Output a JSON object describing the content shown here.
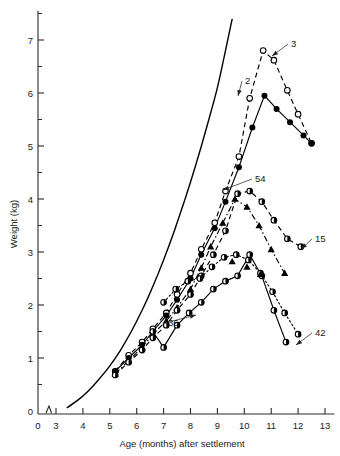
{
  "chart_data": {
    "type": "line",
    "title": "",
    "xlabel": "Age (months) after settlement",
    "ylabel": "Weight (kg)",
    "xlim": [
      0,
      13.4
    ],
    "ylim": [
      0,
      7.55
    ],
    "grid": false,
    "legend_position": "inline-annotations",
    "x_ticks": [
      0,
      3,
      4,
      5,
      6,
      7,
      8,
      9,
      10,
      11,
      12,
      13
    ],
    "x_tick_labels": [
      "0",
      "3",
      "4",
      "5",
      "6",
      "7",
      "8",
      "9",
      "10",
      "11",
      "12",
      "13"
    ],
    "y_ticks": [
      0,
      1,
      2,
      3,
      4,
      5,
      6,
      7
    ],
    "y_tick_labels": [
      "0",
      "1",
      "2",
      "3",
      "4",
      "5",
      "6",
      "7"
    ],
    "y_minor_ticks": [
      0.5,
      1.5,
      2.5,
      3.5,
      4.5,
      5.5,
      6.5,
      7.5
    ],
    "axis_break_x": 2.6,
    "series": [
      {
        "name": "reference-growth-curve",
        "label": "",
        "marker": "none",
        "linestyle": "solid",
        "x": [
          3.4,
          3.8,
          4.2,
          4.6,
          5.0,
          5.4,
          5.8,
          6.2,
          6.6,
          7.0,
          7.4,
          7.8,
          8.2,
          8.6,
          9.0,
          9.3,
          9.55
        ],
        "y": [
          0.06,
          0.2,
          0.38,
          0.6,
          0.85,
          1.15,
          1.5,
          1.9,
          2.35,
          2.85,
          3.4,
          4.0,
          4.65,
          5.35,
          6.1,
          6.8,
          7.4
        ]
      },
      {
        "name": "series-3",
        "label": "3",
        "marker": "open-circle",
        "linestyle": "dashed",
        "x": [
          5.2,
          5.7,
          6.2,
          6.6,
          7.1,
          7.5,
          8.0,
          8.4,
          8.9,
          9.3,
          9.8,
          10.2,
          10.7,
          11.1,
          11.6,
          12.0,
          12.5
        ],
        "y": [
          0.75,
          1.05,
          1.3,
          1.55,
          1.85,
          2.2,
          2.6,
          3.05,
          3.55,
          4.15,
          4.8,
          5.9,
          6.8,
          6.62,
          6.05,
          5.6,
          5.05
        ]
      },
      {
        "name": "series-2",
        "label": "2",
        "marker": "filled-circle",
        "linestyle": "solid",
        "x": [
          5.2,
          5.7,
          6.2,
          6.6,
          7.1,
          7.5,
          8.0,
          8.4,
          8.9,
          9.3,
          9.8,
          10.3,
          10.75,
          11.2,
          11.7,
          12.2,
          12.5
        ],
        "y": [
          0.75,
          1.0,
          1.25,
          1.5,
          1.8,
          2.1,
          2.5,
          2.95,
          3.45,
          3.95,
          4.6,
          5.35,
          5.95,
          5.7,
          5.45,
          5.2,
          5.05
        ]
      },
      {
        "name": "series-54",
        "label": "54",
        "marker": "filled-triangle",
        "linestyle": "dash-dot",
        "x": [
          5.2,
          5.7,
          6.2,
          6.6,
          7.1,
          7.5,
          8.0,
          8.4,
          8.75,
          9.2,
          9.65,
          10.1,
          10.55,
          11.0,
          11.5
        ],
        "y": [
          0.7,
          0.95,
          1.2,
          1.45,
          1.7,
          1.95,
          2.3,
          2.7,
          3.1,
          3.55,
          4.0,
          3.85,
          3.5,
          3.05,
          2.6
        ]
      },
      {
        "name": "series-15",
        "label": "15",
        "marker": "half-filled-circle",
        "linestyle": "dashed",
        "x": [
          5.2,
          5.7,
          6.2,
          6.6,
          7.1,
          7.5,
          8.0,
          8.4,
          8.85,
          9.3,
          9.75,
          10.2,
          10.65,
          11.1,
          11.6,
          12.1
        ],
        "y": [
          0.68,
          0.92,
          1.15,
          1.38,
          1.62,
          1.9,
          2.2,
          2.55,
          2.95,
          3.4,
          4.1,
          4.15,
          3.95,
          3.6,
          3.25,
          3.1
        ]
      },
      {
        "name": "series-42",
        "label": "42",
        "marker": "half-filled-circle",
        "linestyle": "dotted",
        "x": [
          7.0,
          7.45,
          7.9,
          8.35,
          8.8,
          9.25,
          9.7,
          10.15,
          10.6,
          11.05,
          11.5,
          12.0
        ],
        "y": [
          2.05,
          2.3,
          2.45,
          2.5,
          2.72,
          2.9,
          2.95,
          2.85,
          2.6,
          2.25,
          1.85,
          1.45
        ]
      },
      {
        "name": "series-36",
        "label": "36",
        "marker": "half-filled-circle",
        "linestyle": "solid",
        "x": [
          6.6,
          7.0,
          7.5,
          7.95,
          8.4,
          8.85,
          9.3,
          9.75,
          10.2,
          10.65,
          11.1,
          11.55
        ],
        "y": [
          1.5,
          1.2,
          1.62,
          1.85,
          2.05,
          2.3,
          2.45,
          2.55,
          2.95,
          2.55,
          1.9,
          1.3
        ]
      },
      {
        "name": "series-lower-triangle-set",
        "label": "",
        "marker": "filled-triangle",
        "linestyle": "none",
        "x": [
          9.55,
          10.1,
          10.6
        ],
        "y": [
          2.82,
          2.72,
          2.58
        ]
      }
    ],
    "annotations": [
      {
        "label": "3",
        "x_px": 291,
        "y_px": 43,
        "leader_to_x_px": 272,
        "leader_to_y_px": 56
      },
      {
        "label": "2",
        "x_px": 245,
        "y_px": 80,
        "leader_to_x_px": 238,
        "leader_to_y_px": 96
      },
      {
        "label": "54",
        "x_px": 255,
        "y_px": 178,
        "leader_to_x_px": 223,
        "leader_to_y_px": 190
      },
      {
        "label": "15",
        "x_px": 315,
        "y_px": 238,
        "leader_to_x_px": 301,
        "leader_to_y_px": 249
      },
      {
        "label": "36",
        "x_px": 168,
        "y_px": 322,
        "leader_to_x_px": 196,
        "leader_to_y_px": 315
      },
      {
        "label": "42",
        "x_px": 315,
        "y_px": 332,
        "leader_to_x_px": 296,
        "leader_to_y_px": 345
      }
    ]
  }
}
